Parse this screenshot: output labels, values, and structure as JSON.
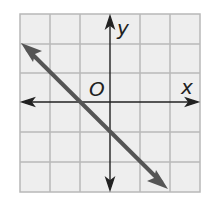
{
  "graph": {
    "x_label": "x",
    "y_label": "y",
    "origin_label": "O",
    "grid": {
      "cols": 6,
      "rows": 6,
      "x_range": [
        -3,
        3
      ],
      "y_range": [
        -3,
        3
      ]
    },
    "line": {
      "equation": "y = -x - 1",
      "slope": -1,
      "y_intercept": -1,
      "x_intercept": -1,
      "from": [
        -3.0,
        2.0
      ],
      "to": [
        2.0,
        -3.0
      ]
    },
    "colors": {
      "grid": "#b8b8b8",
      "cell_fill": "#eeeeee",
      "axis": "#222222",
      "line": "#555555"
    }
  }
}
